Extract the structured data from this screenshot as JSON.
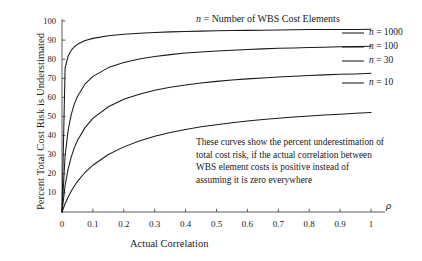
{
  "chart_data": {
    "type": "line",
    "title": "",
    "xlabel": "Actual Correlation",
    "ylabel": "Percent Total Cost Risk is Understimated",
    "x_axis_symbol": "ρ",
    "xlim": [
      0,
      1
    ],
    "ylim": [
      0,
      100
    ],
    "xticks": [
      "0",
      "0.1",
      "0.2",
      "0.3",
      "0.4",
      "0.5",
      "0.6",
      "0.7",
      "0.8",
      "0.9",
      "1"
    ],
    "xtick_values": [
      0,
      0.1,
      0.2,
      0.3,
      0.4,
      0.5,
      0.6,
      0.7,
      0.8,
      0.9,
      1
    ],
    "yticks": [
      "10",
      "20",
      "30",
      "40",
      "50",
      "60",
      "70",
      "80",
      "90",
      "100"
    ],
    "ytick_values": [
      10,
      20,
      30,
      40,
      50,
      60,
      70,
      80,
      90,
      100
    ],
    "grid": false,
    "legend_position": "right",
    "legend_title": "n = Number of WBS Cost Elements",
    "x": [
      0,
      0.01,
      0.02,
      0.03,
      0.04,
      0.05,
      0.075,
      0.1,
      0.15,
      0.2,
      0.25,
      0.3,
      0.35,
      0.4,
      0.45,
      0.5,
      0.55,
      0.6,
      0.65,
      0.7,
      0.75,
      0.8,
      0.85,
      0.9,
      0.95,
      1
    ],
    "series": [
      {
        "name": "n = 1000",
        "n": 1000,
        "values": [
          0,
          75.4,
          81.7,
          84.7,
          86.5,
          87.8,
          89.8,
          90.9,
          92.3,
          93.1,
          93.6,
          94.0,
          94.3,
          94.5,
          94.7,
          94.9,
          95.0,
          95.1,
          95.2,
          95.3,
          95.4,
          95.5,
          95.5,
          95.6,
          95.6,
          95.7
        ]
      },
      {
        "name": "n = 100",
        "n": 100,
        "values": [
          0,
          29.3,
          43.0,
          51.1,
          56.6,
          60.5,
          67.1,
          71.0,
          75.6,
          78.3,
          80.1,
          81.4,
          82.4,
          83.2,
          83.8,
          84.3,
          84.7,
          85.1,
          85.4,
          85.7,
          85.9,
          86.1,
          86.3,
          86.5,
          86.6,
          86.8
        ]
      },
      {
        "name": "n = 30",
        "n": 30,
        "values": [
          0,
          13.8,
          22.6,
          28.9,
          33.7,
          37.4,
          44.3,
          49.0,
          55.1,
          59.0,
          61.7,
          63.7,
          65.3,
          66.5,
          67.5,
          68.4,
          69.1,
          69.7,
          70.2,
          70.7,
          71.1,
          71.5,
          71.8,
          72.1,
          72.3,
          72.6
        ]
      },
      {
        "name": "n = 10",
        "n": 10,
        "values": [
          0,
          4.3,
          7.9,
          11.0,
          13.6,
          16.0,
          20.8,
          24.5,
          30.1,
          34.1,
          37.2,
          39.6,
          41.6,
          43.2,
          44.6,
          45.7,
          46.7,
          47.6,
          48.4,
          49.1,
          49.7,
          50.3,
          50.8,
          51.2,
          51.7,
          52.1
        ]
      }
    ],
    "annotation": [
      "These curves show the percent underestimation of",
      "total cost risk, if the actual correlation between",
      "WBS element costs is positive instead of",
      "assuming it is zero everywhere"
    ],
    "legend_entries": [
      {
        "label_italic": "n",
        "label_rest": " = 1000"
      },
      {
        "label_italic": "n",
        "label_rest": " = 100"
      },
      {
        "label_italic": "n",
        "label_rest": " = 30"
      },
      {
        "label_italic": "n",
        "label_rest": " = 10"
      }
    ],
    "colors": {
      "line": "#1a1a1a",
      "axis": "#4a4a4a",
      "text": "#1a1a1a",
      "background": "#ffffff"
    }
  }
}
